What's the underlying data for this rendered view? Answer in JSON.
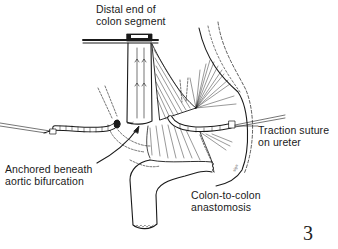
{
  "figure": {
    "number": "3",
    "labels": {
      "distal_end": {
        "line1": "Distal end of",
        "line2": "colon segment"
      },
      "traction_suture": {
        "line1": "Traction suture",
        "line2": "on ureter"
      },
      "anchored": {
        "line1": "Anchored beneath",
        "line2": "aortic bifurcation"
      },
      "anastomosis": {
        "line1": "Colon-to-colon",
        "line2": "anastomosis"
      }
    }
  },
  "colors": {
    "ink": "#1a1a1a",
    "background": "#ffffff"
  }
}
